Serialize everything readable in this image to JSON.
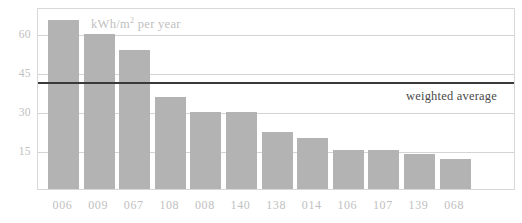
{
  "chart_data": {
    "type": "bar",
    "title": "",
    "subtitle": "",
    "units_caption": "kWh/m",
    "units_caption_sup": "2",
    "units_caption_tail": " per year",
    "xlabel": "",
    "ylabel": "",
    "categories": [
      "006",
      "009",
      "067",
      "108",
      "008",
      "140",
      "138",
      "014",
      "106",
      "107",
      "139",
      "068"
    ],
    "values": [
      65,
      59.5,
      53.5,
      35.5,
      29.5,
      29.5,
      22,
      19.5,
      15,
      15,
      13.5,
      11.5
    ],
    "ylim": [
      0,
      70
    ],
    "yticks": [
      15,
      30,
      45,
      60
    ],
    "ytick_labels": [
      "15",
      "30",
      "45",
      "60"
    ],
    "grid": true,
    "grid_axis": "y",
    "legend": "none",
    "annotations": [
      {
        "name": "weighted-average",
        "label": "weighted average",
        "value": 41.8,
        "style": "horizontal-line"
      }
    ],
    "colors": {
      "bar": "#b3b3b3",
      "gridline": "#d4d4d4",
      "frame": "#d8d8d8",
      "average_line": "#3a3a3a",
      "tick_label": "#c0c0c0",
      "annotation_label": "#4a4a4a",
      "background": "#ffffff"
    }
  }
}
